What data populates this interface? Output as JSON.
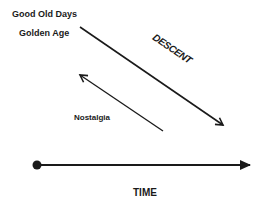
{
  "diagram": {
    "labels": {
      "good_old_days": "Good Old Days",
      "golden_age": "Golden Age",
      "descent": "DESCENT",
      "nostalgia": "Nostalgia",
      "time": "TIME"
    },
    "arrows": [
      {
        "name": "descent-arrow",
        "from": [
          80,
          27
        ],
        "to": [
          223,
          125
        ]
      },
      {
        "name": "nostalgia-arrow",
        "from": [
          163,
          131
        ],
        "to": [
          80,
          75
        ]
      },
      {
        "name": "time-axis",
        "from": [
          37,
          165
        ],
        "to": [
          252,
          165
        ]
      }
    ],
    "color": "#1a1a1a"
  }
}
